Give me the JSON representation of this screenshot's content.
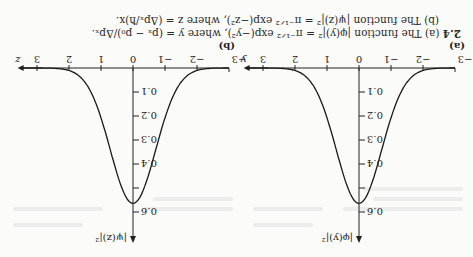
{
  "figure": {
    "number": "2.4",
    "caption_a": "(a) The function |φ(y)|² = π⁻¹ᐟ² exp(−y²), where y = (pₓ − p₀)/Δpₓ.",
    "caption_b": "(b) The function |ψ(z)|² = π⁻¹ᐟ² exp(−z²), where z = (Δpₓ/ħ)x.",
    "orientation": "rotated 180°"
  },
  "panels": [
    {
      "label": "(a)",
      "ylabel": "|φ(y)|²",
      "xlabel": "y"
    },
    {
      "label": "(b)",
      "ylabel": "|ψ(z)|²",
      "xlabel": "z"
    }
  ],
  "chart_data": [
    {
      "type": "line",
      "title": "(a) |φ(y)|² = π^(-1/2) exp(-y²)",
      "xlabel": "y",
      "ylabel": "|φ(y)|²",
      "x_ticks": [
        "-3",
        "-2",
        "-1",
        "0",
        "1",
        "2",
        "3"
      ],
      "y_ticks": [
        "0.1",
        "0.2",
        "0.3",
        "0.4",
        "0.6"
      ],
      "xlim": [
        -3,
        3
      ],
      "ylim": [
        0,
        0.65
      ],
      "grid": false,
      "x": [
        -3,
        -2.5,
        -2,
        -1.5,
        -1,
        -0.5,
        0,
        0.5,
        1,
        1.5,
        2,
        2.5,
        3
      ],
      "values": [
        0.0001,
        0.001,
        0.01,
        0.059,
        0.208,
        0.439,
        0.564,
        0.439,
        0.208,
        0.059,
        0.01,
        0.001,
        0.0001
      ]
    },
    {
      "type": "line",
      "title": "(b) |ψ(z)|² = π^(-1/2) exp(-z²)",
      "xlabel": "z",
      "ylabel": "|ψ(z)|²",
      "x_ticks": [
        "-3",
        "-2",
        "-1",
        "0",
        "1",
        "2",
        "3"
      ],
      "y_ticks": [
        "0.1",
        "0.2",
        "0.3",
        "0.4",
        "0.6"
      ],
      "xlim": [
        -3,
        3
      ],
      "ylim": [
        0,
        0.65
      ],
      "grid": false,
      "x": [
        -3,
        -2.5,
        -2,
        -1.5,
        -1,
        -0.5,
        0,
        0.5,
        1,
        1.5,
        2,
        2.5,
        3
      ],
      "values": [
        0.0001,
        0.001,
        0.01,
        0.059,
        0.208,
        0.439,
        0.564,
        0.439,
        0.208,
        0.059,
        0.01,
        0.001,
        0.0001
      ]
    }
  ]
}
